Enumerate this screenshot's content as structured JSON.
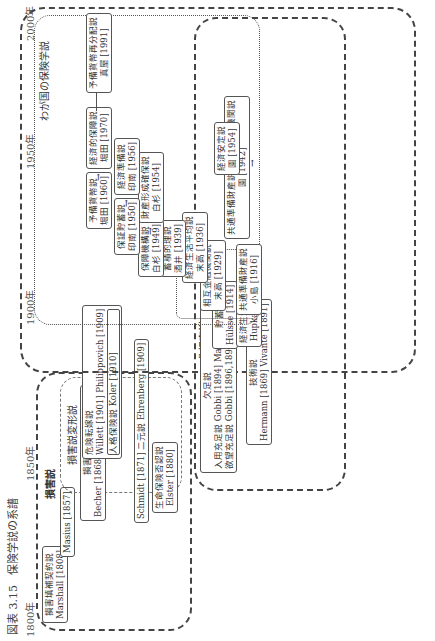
{
  "caption": {
    "figure_no": "図表 3.15",
    "title": "保険学説の系譜"
  },
  "timeline": {
    "years": [
      "1800年",
      "1850年",
      "1900年",
      "1950年",
      "2000年"
    ]
  },
  "regions": {
    "damage": "損害説",
    "damage_variant": "損害説変形説",
    "non_damage": "非損害説",
    "japan": "わが国の保険学説"
  },
  "boxes": {
    "indemnity_contract": {
      "title": "損害填補契約説",
      "authors": "Marshall [1808]"
    },
    "masius": {
      "title": "",
      "authors": "Masius [1857]"
    },
    "loss_sharing": {
      "title": "損害分担説",
      "authors": "Becher [1868]  Wagner [1881]"
    },
    "risk_transfer": {
      "title": "危険転嫁説",
      "authors": "Willett [1901]  Philippovich [1909]"
    },
    "personal_insurance": {
      "title": "人格保険説",
      "authors": "Koler [1910]"
    },
    "dualism": {
      "title": "Schmidt [1871] 二元説 Ehrenberg [1909]",
      "authors": ""
    },
    "life_insurance_denial": {
      "title": "生命保険否認説",
      "authors": "Elster [1880]"
    },
    "need_theory": {
      "title": "欠足説",
      "authors": ""
    },
    "need_lines": {
      "line1": "入用充足説 Gobbi [1894]  Manes [1905]",
      "line2": "欲望充足説 Gobbi [1896,1897]"
    },
    "technical": {
      "title": "技術説",
      "authors": "Hermann [1869]  Vivante [1891]"
    },
    "savings": {
      "title": "貯蓄説",
      "authors": "Hülsse [1914]"
    },
    "economic_life": {
      "title": "経済生活確保説",
      "authors": "Hupka [1910]"
    },
    "common_reserve": {
      "title": "共通準備財産説",
      "authors": "小島 [1916]"
    },
    "mutual_finance": {
      "title": "相互金融機関説",
      "authors": "末高 [1929]"
    },
    "common_reserve_mutual": {
      "title": "共通準備財産説＋相互金融機関説",
      "authors": "園 [1942]"
    },
    "economic_balance": {
      "title": "経済生活平均説",
      "authors": "末高 [1936]"
    },
    "reserve_theory": {
      "title": "蓄積的理説",
      "authors": "酒井 [1939]"
    },
    "economic_stability": {
      "title": "経済安定説",
      "authors": "園 [1954]"
    },
    "preparation_fund": {
      "title": "保障機構説",
      "authors": "白杉 [1949]"
    },
    "asset_formation": {
      "title": "財産形成確保説",
      "authors": "白杉 [1954]"
    },
    "insurance_savings": {
      "title": "保証貯蓄説",
      "authors": "印南 [1950]"
    },
    "economic_preparation": {
      "title": "経済準備説",
      "authors": "印南 [1956]"
    },
    "reserve_currency": {
      "title": "予備貨幣説",
      "authors": "堀田 [1960]"
    },
    "economic_security": {
      "title": "経済的保障説",
      "authors": "堀田 [1970]"
    },
    "reserve_redistribution": {
      "title": "予備貨幣再分配説",
      "authors": "真屋 [1991]"
    }
  },
  "icons": {
    "arrow": "→"
  }
}
